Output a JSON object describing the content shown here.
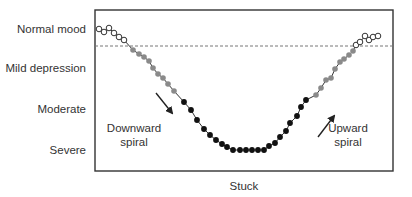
{
  "chart_data": {
    "type": "line",
    "title": "",
    "xlabel": "Stuck",
    "ylabel": "",
    "y_levels": [
      "Normal mood",
      "Mild depression",
      "Moderate",
      "Severe"
    ],
    "threshold": {
      "style": "dashed",
      "between": [
        "Normal mood",
        "Mild depression"
      ]
    },
    "annotations": [
      {
        "text_lines": [
          "Downward",
          "spiral"
        ],
        "arrow": "down-right"
      },
      {
        "text_lines": [
          "Upward",
          "spiral"
        ],
        "arrow": "up-right"
      }
    ],
    "series": [
      {
        "name": "normal-left",
        "marker": "open-circle",
        "points": [
          [
            99,
            29
          ],
          [
            104,
            32
          ],
          [
            109,
            28
          ],
          [
            114,
            33
          ],
          [
            119,
            37
          ],
          [
            124,
            40
          ]
        ]
      },
      {
        "name": "mild-descending",
        "marker": "gray-circle",
        "points": [
          [
            133,
            50
          ],
          [
            139,
            54
          ],
          [
            144,
            57
          ],
          [
            149,
            61
          ],
          [
            153,
            68
          ],
          [
            158,
            74
          ],
          [
            163,
            78
          ],
          [
            168,
            84
          ],
          [
            174,
            91
          ]
        ]
      },
      {
        "name": "moderate-severe",
        "marker": "black-circle",
        "points": [
          [
            184,
            102
          ],
          [
            191,
            110
          ],
          [
            197,
            120
          ],
          [
            204,
            129
          ],
          [
            210,
            135
          ],
          [
            216,
            140
          ],
          [
            222,
            144
          ],
          [
            227,
            147
          ],
          [
            233,
            150
          ],
          [
            240,
            150
          ],
          [
            246,
            150
          ],
          [
            252,
            150
          ],
          [
            258,
            150
          ],
          [
            264,
            150
          ],
          [
            269,
            146
          ],
          [
            275,
            143
          ],
          [
            280,
            137
          ],
          [
            286,
            131
          ],
          [
            290,
            123
          ],
          [
            297,
            116
          ],
          [
            301,
            107
          ],
          [
            306,
            100
          ]
        ]
      },
      {
        "name": "mild-ascending",
        "marker": "gray-circle",
        "points": [
          [
            316,
            95
          ],
          [
            321,
            88
          ],
          [
            326,
            80
          ],
          [
            331,
            78
          ],
          [
            335,
            69
          ],
          [
            340,
            62
          ],
          [
            344,
            59
          ],
          [
            349,
            55
          ],
          [
            353,
            51
          ]
        ]
      },
      {
        "name": "normal-right",
        "marker": "open-circle",
        "points": [
          [
            356,
            45
          ],
          [
            360,
            42
          ],
          [
            365,
            36
          ],
          [
            369,
            40
          ],
          [
            373,
            37
          ],
          [
            378,
            36
          ]
        ]
      }
    ]
  },
  "labels": {
    "normal": "Normal mood",
    "mild": "Mild depression",
    "moderate": "Moderate",
    "severe": "Severe",
    "downward_1": "Downward",
    "downward_2": "spiral",
    "upward_1": "Upward",
    "upward_2": "spiral",
    "stuck": "Stuck"
  },
  "colors": {
    "frame": "#333333",
    "dash": "#777777",
    "line": "#333333",
    "gray_marker": "#8a8a8a",
    "black_marker": "#111111",
    "open_marker_fill": "#ffffff"
  }
}
